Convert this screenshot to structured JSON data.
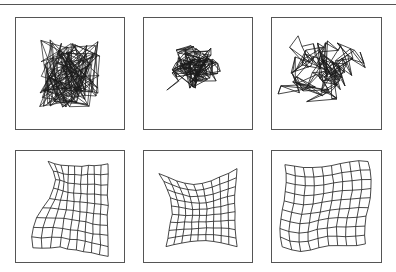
{
  "figure": {
    "type": "som-training-stages",
    "grid_size": 10,
    "stroke_color": "#1a1a1a",
    "border_color": "#555555",
    "panels": [
      {
        "id": "stage-1",
        "x": 15,
        "y": 17,
        "w": 110,
        "h": 113,
        "mode": "tangle",
        "cx": 0.5,
        "cy": 0.5,
        "spread": 0.38,
        "seed": 7
      },
      {
        "id": "stage-2",
        "x": 143,
        "y": 17,
        "w": 110,
        "h": 113,
        "mode": "partial",
        "cx": 0.48,
        "cy": 0.46,
        "spread": 0.3,
        "seed": 13,
        "order": 0.25
      },
      {
        "id": "stage-3",
        "x": 271,
        "y": 17,
        "w": 111,
        "h": 113,
        "mode": "partial",
        "cx": 0.52,
        "cy": 0.5,
        "spread": 0.45,
        "seed": 21,
        "order": 0.5
      },
      {
        "id": "stage-4",
        "x": 15,
        "y": 150,
        "w": 110,
        "h": 113,
        "mode": "fold",
        "seed": 31
      },
      {
        "id": "stage-5",
        "x": 143,
        "y": 150,
        "w": 110,
        "h": 113,
        "mode": "warp",
        "seed": 41
      },
      {
        "id": "stage-6",
        "x": 271,
        "y": 150,
        "w": 111,
        "h": 113,
        "mode": "near",
        "seed": 51
      }
    ]
  }
}
